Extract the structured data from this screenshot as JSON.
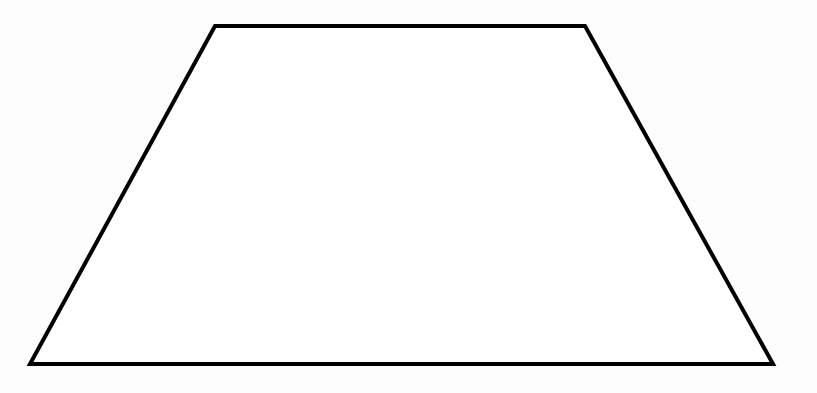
{
  "canvas": {
    "name": "geometric-figure-canvas",
    "width": 817,
    "height": 393,
    "background_color": "#fdfdfd"
  },
  "figure": {
    "name": "trapezoid",
    "shape_type": "trapezoid",
    "stroke_color": "#000000",
    "fill_color": "#ffffff",
    "stroke_width": 4,
    "closed": true,
    "vertices": [
      {
        "label": "top-left",
        "x": 215,
        "y": 26
      },
      {
        "label": "top-right",
        "x": 585,
        "y": 26
      },
      {
        "label": "bottom-right",
        "x": 773,
        "y": 364
      },
      {
        "label": "bottom-left",
        "x": 30,
        "y": 364
      }
    ],
    "edges": [
      {
        "name": "top-edge",
        "from": "top-left",
        "to": "top-right"
      },
      {
        "name": "right-edge",
        "from": "top-right",
        "to": "bottom-right"
      },
      {
        "name": "bottom-edge",
        "from": "bottom-right",
        "to": "bottom-left"
      },
      {
        "name": "left-edge",
        "from": "bottom-left",
        "to": "top-left"
      }
    ],
    "points_attr": "215,26 585,26 773,364 30,364"
  },
  "chart_data": {
    "type": "line",
    "title": "",
    "xlabel": "",
    "ylabel": "",
    "x": [
      215,
      585,
      773,
      30,
      215
    ],
    "y": [
      26,
      26,
      364,
      364,
      26
    ],
    "series": [
      {
        "name": "trapezoid-outline",
        "values": [
          26,
          26,
          364,
          364,
          26
        ]
      }
    ],
    "categories": [
      "top-left",
      "top-right",
      "bottom-right",
      "bottom-left",
      "top-left"
    ],
    "xlim": [
      0,
      817
    ],
    "ylim": [
      0,
      393
    ],
    "grid": false,
    "legend": "none"
  }
}
